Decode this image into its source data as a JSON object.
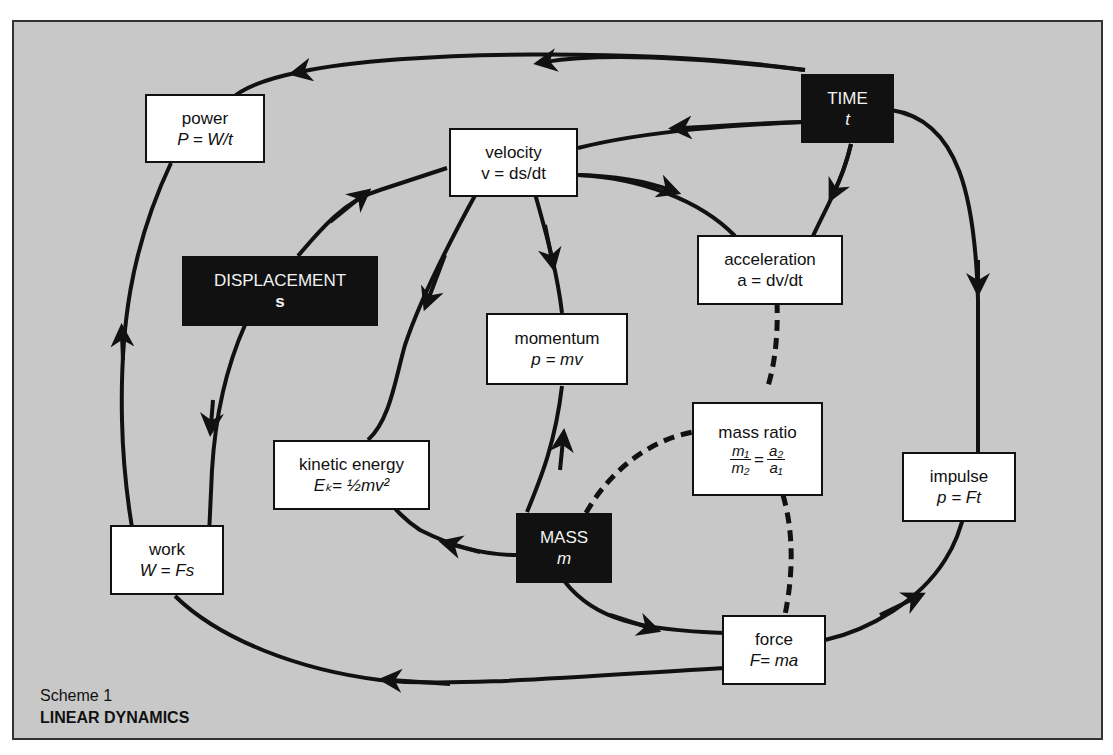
{
  "caption": {
    "scheme": "Scheme 1",
    "title": "LINEAR DYNAMICS"
  },
  "nodes": {
    "power": {
      "label": "power",
      "formula": "P = W/t"
    },
    "velocity": {
      "label": "velocity",
      "formula": "v = ds/dt"
    },
    "time": {
      "label": "TIME",
      "symbol": "t"
    },
    "displacement": {
      "label": "DISPLACEMENT",
      "symbol": "s"
    },
    "acceleration": {
      "label": "acceleration",
      "formula": "a = dv/dt"
    },
    "momentum": {
      "label": "momentum",
      "formula": "p = mv"
    },
    "mass_ratio": {
      "label": "mass ratio",
      "num1": "m₁",
      "den1": "m₂",
      "eq": "=",
      "num2": "a₂",
      "den2": "a₁"
    },
    "kinetic_energy": {
      "label": "kinetic energy",
      "formula": "Eₖ= ½mv²"
    },
    "impulse": {
      "label": "impulse",
      "formula": "p = Ft"
    },
    "work": {
      "label": "work",
      "formula": "W = Fs"
    },
    "mass": {
      "label": "MASS",
      "symbol": "m"
    },
    "force": {
      "label": "force",
      "formula": "F= ma"
    }
  },
  "colors": {
    "background": "#c8c8c8",
    "node_fill": "#ffffff",
    "dark_node_fill": "#111111",
    "line": "#111111"
  }
}
